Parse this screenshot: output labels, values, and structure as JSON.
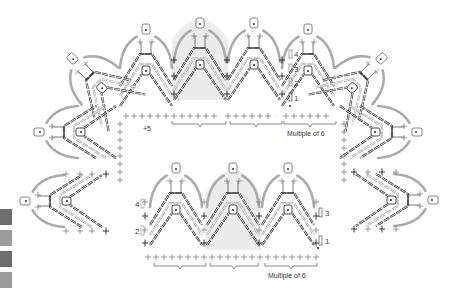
{
  "diagram": {
    "upper_chart": {
      "corner_label": "+5",
      "repeat_label": "Multiple of 6",
      "row_numbers": [
        "1",
        "2",
        "3",
        "4"
      ],
      "repeats": 3
    },
    "lower_chart": {
      "repeat_label": "Multiple of 6",
      "row_numbers_left": [
        "2",
        "4"
      ],
      "row_numbers_right": [
        "1",
        "3"
      ],
      "repeats": 3
    },
    "symbols": {
      "chain": "ch-oval",
      "single_crochet": "sc-cross",
      "double_crochet": "dc-post",
      "slip_stitch": "sl-dot"
    },
    "colors": {
      "ink": "#3a3a3a",
      "light_ink": "#9a9a9a",
      "highlight": "#ececec",
      "swatch_dark": "#6e6e6e",
      "swatch_light": "#9c9c9c"
    },
    "swatches": [
      "dark",
      "light",
      "dark",
      "light"
    ]
  }
}
